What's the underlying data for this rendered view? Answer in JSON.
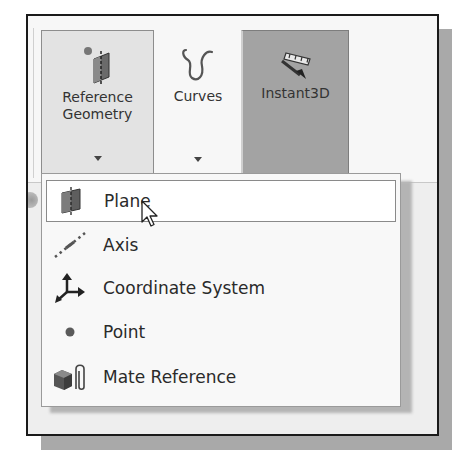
{
  "ribbon": {
    "buttons": [
      {
        "id": "reference-geometry",
        "label_line1": "Reference",
        "label_line2": "Geometry",
        "icon": "reference-geometry-icon",
        "has_dropdown": true,
        "state": "pressed"
      },
      {
        "id": "curves",
        "label_line1": "Curves",
        "icon": "curves-icon",
        "has_dropdown": true,
        "state": "normal"
      },
      {
        "id": "instant3d",
        "label_line1": "Instant3D",
        "icon": "instant3d-icon",
        "has_dropdown": false,
        "state": "active"
      }
    ]
  },
  "dropdown_menu": {
    "items": [
      {
        "label": "Plane",
        "icon": "plane-icon",
        "highlighted": true
      },
      {
        "label": "Axis",
        "icon": "axis-icon",
        "highlighted": false
      },
      {
        "label": "Coordinate System",
        "icon": "coordinate-system-icon",
        "highlighted": false
      },
      {
        "label": "Point",
        "icon": "point-icon",
        "highlighted": false
      },
      {
        "label": "Mate Reference",
        "icon": "mate-reference-icon",
        "highlighted": false
      }
    ]
  },
  "colors": {
    "frame_border": "#1a1a1a",
    "pressed_button": "#e3e3e3",
    "active_button": "#a3a3a3",
    "menu_bg": "#f8f8f8",
    "highlight_bg": "#ffffff"
  }
}
